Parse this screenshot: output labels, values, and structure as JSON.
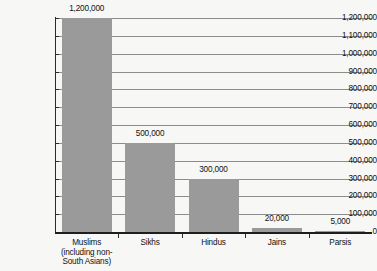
{
  "chart_data": {
    "type": "bar",
    "title": "",
    "subtitle": "",
    "xlabel": "",
    "ylabel": "",
    "categories": [
      "Muslims (including non-South Asians)",
      "Sikhs",
      "Hindus",
      "Jains",
      "Parsis"
    ],
    "category_lines": [
      [
        "Muslims",
        "(including non-",
        "South Asians)"
      ],
      [
        "Sikhs"
      ],
      [
        "Hindus"
      ],
      [
        "Jains"
      ],
      [
        "Parsis"
      ]
    ],
    "values": [
      1200000,
      500000,
      300000,
      20000,
      5000
    ],
    "value_labels": [
      "1,200,000",
      "500,000",
      "300,000",
      "20,000",
      "5,000"
    ],
    "ylim": [
      0,
      1200000
    ],
    "ytick_values": [
      1200000,
      1100000,
      1000000,
      900000,
      800000,
      700000,
      600000,
      500000,
      400000,
      300000,
      200000,
      100000,
      0
    ],
    "ytick_labels": [
      "1,200,000",
      "1,100,000",
      "1,000,000",
      "900,000",
      "800,000",
      "700,000",
      "600,000",
      "500,000",
      "400,000",
      "300,000",
      "200,000",
      "100,000",
      "0"
    ],
    "grid": true,
    "grid_axis": "y",
    "legend": false,
    "legend_position": "none",
    "bar_color": "#9a9a9a",
    "background_color": "#f7f7f5",
    "gridline_color": "#8c8c8c",
    "axis_color": "#1e1e1e",
    "text_color": "#111111"
  }
}
